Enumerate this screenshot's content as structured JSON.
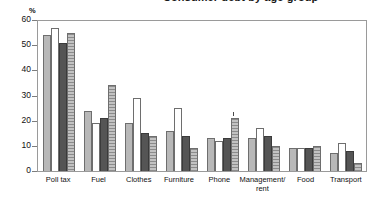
{
  "title_strip": {
    "text": "Consumer debt by age group"
  },
  "axis": {
    "unit_label": "%",
    "y_ticks": [
      "0",
      "10",
      "20",
      "30",
      "40",
      "50",
      "60"
    ]
  },
  "chart_data": {
    "type": "bar",
    "title": "",
    "xlabel": "",
    "ylabel": "%",
    "ylim": [
      0,
      60
    ],
    "grid": false,
    "legend": "none",
    "categories": [
      "Poll tax",
      "Fuel",
      "Clothes",
      "Furniture",
      "Phone",
      "Management/\nrent",
      "Food",
      "Transport"
    ],
    "series": [
      {
        "name": "Series 1",
        "color": "#b8b8b8",
        "fill": "light-grey",
        "values": [
          54,
          24,
          19,
          16,
          13,
          13,
          9,
          7
        ]
      },
      {
        "name": "Series 2",
        "color": "#ffffff",
        "fill": "white",
        "values": [
          57,
          19,
          29,
          25,
          12,
          17,
          9,
          11
        ]
      },
      {
        "name": "Series 3",
        "color": "#555555",
        "fill": "dark-grey",
        "values": [
          51,
          21,
          15,
          14,
          13,
          14,
          9,
          8
        ]
      },
      {
        "name": "Series 4",
        "color": "#c2c2c2",
        "fill": "hatched-grey",
        "values": [
          55,
          34,
          14,
          9,
          21,
          10,
          10,
          3
        ]
      }
    ]
  }
}
